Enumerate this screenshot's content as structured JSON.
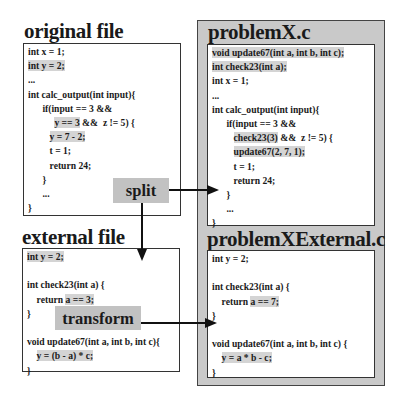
{
  "original": {
    "title": "original file",
    "lines": [
      {
        "pre": "int x = 1;",
        "hl": "",
        "post": ""
      },
      {
        "pre": "",
        "hl": "int y = 2;",
        "post": ""
      },
      {
        "pre": "...",
        "hl": "",
        "post": ""
      },
      {
        "pre": "int calc_output(int input){",
        "hl": "",
        "post": ""
      },
      {
        "pre": "      if(input == 3 &&",
        "hl": "",
        "post": ""
      },
      {
        "pre": "           ",
        "hl": "y == 3",
        "post": " &&  z != 5) {"
      },
      {
        "pre": "         ",
        "hl": "y = 7 - 2;",
        "post": ""
      },
      {
        "pre": "         t = 1;",
        "hl": "",
        "post": ""
      },
      {
        "pre": "         return 24;",
        "hl": "",
        "post": ""
      },
      {
        "pre": "      }",
        "hl": "",
        "post": ""
      },
      {
        "pre": "      ...",
        "hl": "",
        "post": ""
      },
      {
        "pre": "}",
        "hl": "",
        "post": ""
      }
    ]
  },
  "external": {
    "title": "external file",
    "lines": [
      {
        "pre": "",
        "hl": "int y = 2;",
        "post": ""
      },
      {
        "pre": "",
        "hl": "",
        "post": ""
      },
      {
        "pre": "int check23(int a) {",
        "hl": "",
        "post": ""
      },
      {
        "pre": "    return ",
        "hl": "a == 3;",
        "post": ""
      },
      {
        "pre": "}",
        "hl": "",
        "post": ""
      },
      {
        "pre": "",
        "hl": "",
        "post": ""
      },
      {
        "pre": "void update67(int a, int b, int c){",
        "hl": "",
        "post": ""
      },
      {
        "pre": "    ",
        "hl": "y = (b - a) * c;",
        "post": ""
      },
      {
        "pre": "}",
        "hl": "",
        "post": ""
      }
    ]
  },
  "problemX": {
    "title": "problemX.c",
    "lines": [
      {
        "pre": "",
        "hl": "void update67(int a, int b, int c);",
        "post": ""
      },
      {
        "pre": "",
        "hl": "int check23(int a);",
        "post": ""
      },
      {
        "pre": "int x = 1;",
        "hl": "",
        "post": ""
      },
      {
        "pre": "...",
        "hl": "",
        "post": ""
      },
      {
        "pre": "int calc_output(int input){",
        "hl": "",
        "post": ""
      },
      {
        "pre": "      if(input == 3 &&",
        "hl": "",
        "post": ""
      },
      {
        "pre": "         ",
        "hl": "check23(3)",
        "post": " &&  z != 5) {"
      },
      {
        "pre": "         ",
        "hl": "update67(2, 7, 1);",
        "post": ""
      },
      {
        "pre": "         t = 1;",
        "hl": "",
        "post": ""
      },
      {
        "pre": "         return 24;",
        "hl": "",
        "post": ""
      },
      {
        "pre": "      }",
        "hl": "",
        "post": ""
      },
      {
        "pre": "      ...",
        "hl": "",
        "post": ""
      },
      {
        "pre": "}",
        "hl": "",
        "post": ""
      }
    ]
  },
  "problemXExternal": {
    "title": "problemXExternal.c",
    "lines": [
      {
        "pre": "int y = 2;",
        "hl": "",
        "post": ""
      },
      {
        "pre": "",
        "hl": "",
        "post": ""
      },
      {
        "pre": "int check23(int a) {",
        "hl": "",
        "post": ""
      },
      {
        "pre": "    return ",
        "hl": "a == 7;",
        "post": ""
      },
      {
        "pre": "}",
        "hl": "",
        "post": ""
      },
      {
        "pre": "",
        "hl": "",
        "post": ""
      },
      {
        "pre": "void update67(int a, int b, int c) {",
        "hl": "",
        "post": ""
      },
      {
        "pre": "    ",
        "hl": "y = a * b - c;",
        "post": ""
      },
      {
        "pre": "}",
        "hl": "",
        "post": ""
      }
    ]
  },
  "labels": {
    "split": "split",
    "transform": "transform"
  },
  "colors": {
    "panel_gray": "#c9c9c9",
    "label_gray": "#c2c2c2",
    "highlight": "#d4d4d4"
  }
}
